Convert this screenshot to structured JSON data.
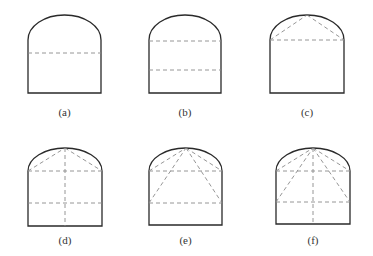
{
  "figure": {
    "panels": [
      {
        "id": "a",
        "label": "(a)",
        "x0": 28,
        "x1": 101,
        "top": 15,
        "spring": 40,
        "bottom": 93,
        "label_y": 106,
        "dashed": [
          [
            28,
            53,
            101,
            53
          ]
        ]
      },
      {
        "id": "b",
        "label": "(b)",
        "x0": 149,
        "x1": 221,
        "top": 15,
        "spring": 40,
        "bottom": 93,
        "label_y": 106,
        "dashed": [
          [
            149,
            41,
            221,
            41
          ],
          [
            149,
            70,
            221,
            70
          ]
        ]
      },
      {
        "id": "c",
        "label": "(c)",
        "x0": 270,
        "x1": 344,
        "top": 15,
        "spring": 40,
        "bottom": 93,
        "label_y": 106,
        "dashed": [
          [
            270,
            40,
            344,
            40
          ],
          [
            270,
            40,
            307,
            15
          ],
          [
            307,
            15,
            344,
            40
          ]
        ]
      },
      {
        "id": "d",
        "label": "(d)",
        "x0": 28,
        "x1": 102,
        "top": 148,
        "spring": 171,
        "bottom": 226,
        "label_y": 234,
        "dashed": [
          [
            28,
            171,
            102,
            171
          ],
          [
            28,
            203,
            102,
            203
          ],
          [
            65,
            148,
            65,
            226
          ],
          [
            28,
            171,
            65,
            148
          ],
          [
            65,
            148,
            102,
            171
          ]
        ]
      },
      {
        "id": "e",
        "label": "(e)",
        "x0": 149,
        "x1": 222,
        "top": 148,
        "spring": 171,
        "bottom": 225,
        "label_y": 234,
        "dashed": [
          [
            149,
            171,
            222,
            171
          ],
          [
            149,
            203,
            222,
            203
          ],
          [
            149,
            171,
            186,
            148
          ],
          [
            186,
            148,
            222,
            171
          ],
          [
            149,
            203,
            186,
            148
          ],
          [
            186,
            148,
            222,
            203
          ]
        ]
      },
      {
        "id": "f",
        "label": "(f)",
        "x0": 276,
        "x1": 350,
        "top": 148,
        "spring": 171,
        "bottom": 224,
        "label_y": 234,
        "dashed": [
          [
            276,
            171,
            350,
            171
          ],
          [
            276,
            202,
            350,
            202
          ],
          [
            313,
            148,
            313,
            224
          ],
          [
            276,
            171,
            313,
            148
          ],
          [
            313,
            148,
            350,
            171
          ],
          [
            276,
            202,
            313,
            148
          ],
          [
            313,
            148,
            350,
            202
          ]
        ]
      }
    ]
  }
}
